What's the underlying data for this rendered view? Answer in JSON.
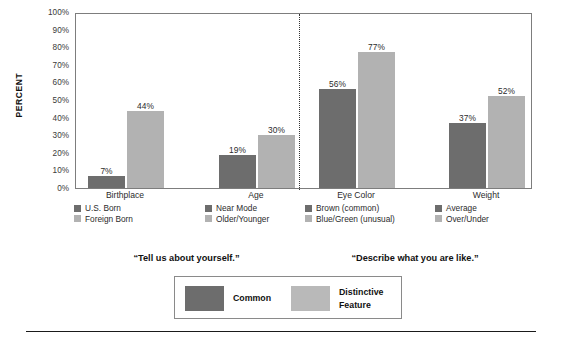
{
  "chart_data": {
    "type": "bar",
    "title": "",
    "xlabel": "",
    "ylabel": "PERCENT",
    "ylim": [
      0,
      100
    ],
    "ytick_labels": [
      "100%",
      "90%",
      "80%",
      "70%",
      "60%",
      "50%",
      "40%",
      "30%",
      "20%",
      "10%",
      "0%"
    ],
    "grid": false,
    "legend_position": "bottom",
    "categories": [
      "Birthplace",
      "Age",
      "Eye Color",
      "Weight"
    ],
    "series": [
      {
        "name": "Common",
        "values": [
          7,
          19,
          56,
          37
        ]
      },
      {
        "name": "Distinctive Feature",
        "values": [
          44,
          30,
          77,
          52
        ]
      }
    ],
    "groups": [
      {
        "category": "Birthplace",
        "common_label": "U.S. Born",
        "distinct_label": "Foreign Born",
        "common_value": 7,
        "distinct_value": 44,
        "common_value_label": "7%",
        "distinct_value_label": "44%"
      },
      {
        "category": "Age",
        "common_label": "Near Mode",
        "distinct_label": "Older/Younger",
        "common_value": 19,
        "distinct_value": 30,
        "common_value_label": "19%",
        "distinct_value_label": "30%"
      },
      {
        "category": "Eye Color",
        "common_label": "Brown (common)",
        "distinct_label": "Blue/Green (unusual)",
        "common_value": 56,
        "distinct_value": 77,
        "common_value_label": "56%",
        "distinct_value_label": "77%"
      },
      {
        "category": "Weight",
        "common_label": "Average",
        "distinct_label": "Over/Under",
        "common_value": 37,
        "distinct_value": 52,
        "common_value_label": "37%",
        "distinct_value_label": "52%"
      }
    ],
    "annotations": [
      {
        "text": "“Tell us about yourself.”",
        "section": "left"
      },
      {
        "text": "“Describe what you are like.”",
        "section": "right"
      }
    ],
    "colors": {
      "common": "#6d6d6d",
      "distinctive": "#b2b2b2",
      "frame": "#7d7d7d",
      "text": "#1a1a1a"
    }
  },
  "key": {
    "common_label": "Common",
    "distinctive_label": "Distinctive\nFeature"
  }
}
